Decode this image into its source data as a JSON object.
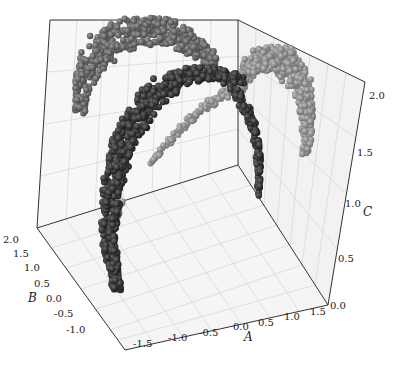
{
  "chart_data": {
    "type": "scatter",
    "projection": "3d",
    "title": "",
    "xlabel": "A",
    "ylabel": "B",
    "zlabel": "C",
    "xlim": [
      -1.5,
      1.5
    ],
    "ylim": [
      -1.0,
      2.0
    ],
    "zlim": [
      0.0,
      2.0
    ],
    "x_ticks": [
      "-1.5",
      "-1.0",
      "-0.5",
      "0.0",
      "0.5",
      "1.0",
      "1.5"
    ],
    "y_ticks": [
      "-1.0",
      "-0.5",
      "0.0",
      "0.5",
      "1.0",
      "1.5",
      "2.0"
    ],
    "z_ticks": [
      "0.0",
      "0.5",
      "1.0",
      "1.5",
      "2.0"
    ],
    "grid": true,
    "legend": null,
    "marker": "sphere",
    "series": [
      {
        "name": "cluster-1",
        "color": "#5a5a5a",
        "shape": "arc (back, upper-left)",
        "approx_points": "dense crescent, C≈1.3–2.0"
      },
      {
        "name": "cluster-2",
        "color": "#2e2e2e",
        "shape": "arc (front, descending to floor)",
        "approx_points": "dense crescent, C≈0.0–2.0"
      },
      {
        "name": "cluster-3",
        "color": "#8a8a8a",
        "shape": "arc (right, upper)",
        "approx_points": "dense crescent, C≈1.0–2.0"
      }
    ]
  },
  "axes": {
    "a_label": "A",
    "b_label": "B",
    "c_label": "C",
    "a_ticks": [
      "-1.5",
      "-1.0",
      "-0.5",
      "0.0",
      "0.5",
      "1.0",
      "1.5"
    ],
    "b_ticks": [
      "2.0",
      "1.5",
      "1.0",
      "0.5",
      "0.0",
      "-0.5",
      "-1.0"
    ],
    "c_ticks": [
      "0.0",
      "0.5",
      "1.0",
      "1.5",
      "2.0"
    ]
  }
}
